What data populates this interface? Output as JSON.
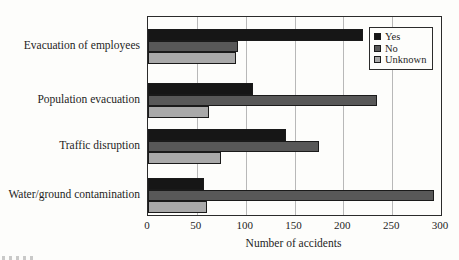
{
  "chart_data": {
    "type": "bar",
    "orientation": "horizontal",
    "title": "",
    "categories": [
      "Evacuation of employees",
      "Population evacuation",
      "Traffic disruption",
      "Water/ground contamination"
    ],
    "series": [
      {
        "name": "Yes",
        "color": "#161616",
        "values": [
          220,
          107,
          141,
          57
        ]
      },
      {
        "name": "No",
        "color": "#585858",
        "values": [
          92,
          234,
          175,
          293
        ]
      },
      {
        "name": "Unknown",
        "color": "#a9a9a9",
        "values": [
          90,
          62,
          75,
          60
        ]
      }
    ],
    "xlabel": "Number of accidents",
    "ylabel": "",
    "xlim": [
      0,
      300
    ],
    "xticks": [
      0,
      50,
      100,
      150,
      200,
      250,
      300
    ],
    "grid": true,
    "legend_position": "top-right-inside",
    "legend_labels": [
      "Yes",
      "No",
      "Unknown"
    ]
  },
  "colors": {
    "background": "#fdfdfb",
    "plot_border": "#2b2b2b",
    "gridline": "#b8b8b8",
    "text": "#1d1d1d"
  }
}
